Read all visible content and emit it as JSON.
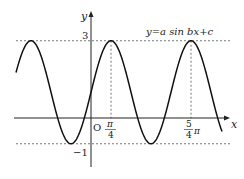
{
  "chart_data": {
    "type": "line",
    "title": "",
    "equation_label": "y=a sin bx+c",
    "function": {
      "a": 2,
      "b": 2,
      "c": 1,
      "expression": "y = 2 sin(2x) + 1"
    },
    "xlabel": "x",
    "ylabel": "y",
    "origin_label": "O",
    "x_ticks": [
      {
        "value": 0.7853981634,
        "num": "π",
        "den": "4",
        "label": "π/4"
      },
      {
        "value": 3.926990817,
        "num": "5",
        "den": "4",
        "suffix": "π",
        "label": "5/4π"
      }
    ],
    "y_ticks": [
      {
        "value": 3,
        "label": "3"
      },
      {
        "value": -1,
        "label": "−1"
      }
    ],
    "reference_lines": {
      "horizontal_dashed": [
        3,
        -1
      ],
      "vertical_dashed": [
        0.7853981634,
        3.926990817
      ]
    },
    "maxima": [
      {
        "x": 0.7853981634,
        "y": 3
      },
      {
        "x": 3.926990817,
        "y": 3
      }
    ],
    "minimum_value": -1,
    "maximum_value": 3,
    "period": "π",
    "xlim_approx": [
      -2.95,
      4.55
    ],
    "ylim_approx": [
      -1.9,
      4.1
    ],
    "grid": false,
    "legend": null
  }
}
